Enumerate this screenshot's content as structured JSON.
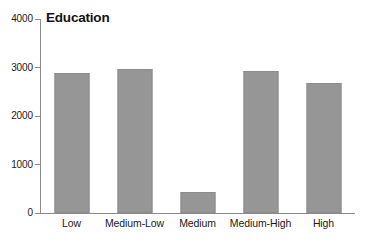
{
  "chart_data": {
    "type": "bar",
    "title": "Education",
    "xlabel": "",
    "ylabel": "",
    "categories": [
      "Low",
      "Medium-Low",
      "Medium",
      "Medium-High",
      "High"
    ],
    "values": [
      2880,
      2960,
      430,
      2920,
      2680
    ],
    "ylim": [
      0,
      4000
    ],
    "yticks": [
      0,
      1000,
      2000,
      3000,
      4000
    ],
    "ytick_labels": [
      "0",
      "1000",
      "2000",
      "3000",
      "4000"
    ],
    "grid": false,
    "legend": "none",
    "bar_color": "#969696",
    "bar_border_color": "#8c8c8c",
    "axis_color": "#8a8a8a",
    "text_color": "#1a1a1a",
    "background": "#ffffff"
  }
}
